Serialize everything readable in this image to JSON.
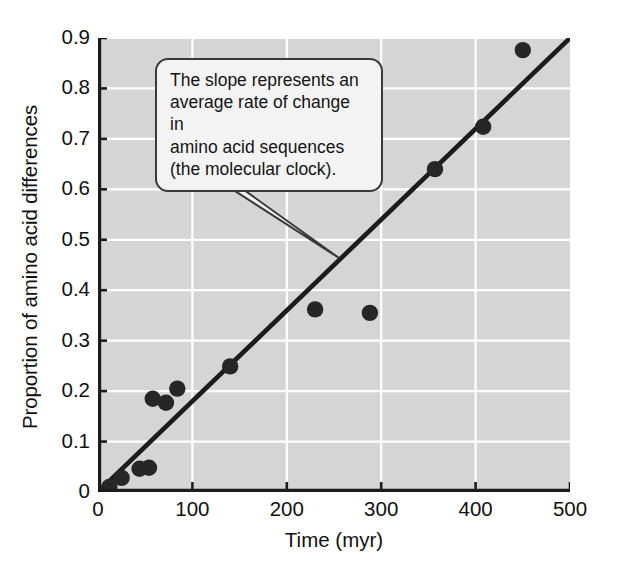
{
  "figure": {
    "background_color": "#ffffff",
    "plot_background_color": "#d5d5d5",
    "grid_color": "#ffffff",
    "marker_color": "#262626",
    "line_color": "#1c1c1c",
    "callout_fill": "#f3f3f3",
    "callout_border": "#3a3a3a"
  },
  "callout": {
    "text": "The slope represents an\naverage rate of change in\namino acid sequences\n(the molecular clock)."
  },
  "caption": {
    "remnant": ""
  },
  "chart_data": {
    "type": "scatter",
    "title": "",
    "xlabel": "Time (myr)",
    "ylabel": "Proportion of amino acid differences",
    "xlim": [
      0,
      500
    ],
    "ylim": [
      0,
      0.9
    ],
    "xticks": [
      0,
      100,
      200,
      300,
      400,
      500
    ],
    "xtick_labels": [
      "0",
      "100",
      "200",
      "300",
      "400",
      "500"
    ],
    "yticks": [
      0,
      0.1,
      0.2,
      0.3,
      0.4,
      0.5,
      0.6,
      0.7,
      0.8,
      0.9
    ],
    "ytick_labels": [
      "0",
      "0.1",
      "0.2",
      "0.3",
      "0.4",
      "0.5",
      "0.6",
      "0.7",
      "0.8",
      "0.9"
    ],
    "grid": true,
    "legend": null,
    "points": [
      {
        "x": 12,
        "y": 0.01
      },
      {
        "x": 25,
        "y": 0.028
      },
      {
        "x": 44,
        "y": 0.046
      },
      {
        "x": 54,
        "y": 0.048
      },
      {
        "x": 58,
        "y": 0.185
      },
      {
        "x": 72,
        "y": 0.177
      },
      {
        "x": 84,
        "y": 0.205
      },
      {
        "x": 140,
        "y": 0.249
      },
      {
        "x": 230,
        "y": 0.362
      },
      {
        "x": 288,
        "y": 0.355
      },
      {
        "x": 357,
        "y": 0.64
      },
      {
        "x": 408,
        "y": 0.724
      },
      {
        "x": 450,
        "y": 0.876
      }
    ],
    "trend_line": {
      "kind": "linear-fit",
      "x_start": 0,
      "y_start": 0.0,
      "x_end": 500,
      "y_end": 0.9
    },
    "annotations": [
      {
        "text": "The slope represents an average rate of change in amino acid sequences (the molecular clock).",
        "points_to_x": 250,
        "points_to_y": 0.455
      }
    ]
  }
}
